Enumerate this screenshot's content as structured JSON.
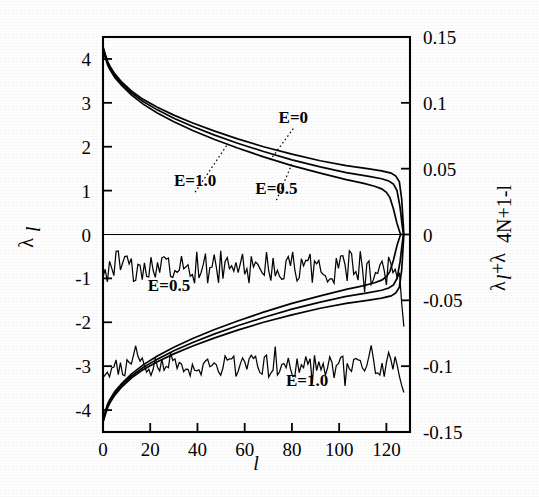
{
  "figure": {
    "background": "#ffffff",
    "ink_color": "#000000"
  },
  "chart_data": {
    "type": "line",
    "title": "",
    "subtitle": "",
    "xlabel": "l",
    "ylabel": "λ_l",
    "ylabel_right": "λ_l+λ_4N+1-l",
    "grid": false,
    "legend_position": "inline-annotations",
    "xlim": [
      0,
      130
    ],
    "ylim": [
      -4.5,
      4.5
    ],
    "ylim_right": [
      -0.15,
      0.15
    ],
    "xticks": [
      0,
      20,
      40,
      60,
      80,
      100,
      120
    ],
    "xtick_labels": [
      "0",
      "20",
      "40",
      "60",
      "80",
      "100",
      "120"
    ],
    "yticks_left": [
      4,
      3,
      2,
      1,
      0,
      -1,
      -2,
      -3,
      -4
    ],
    "ytick_labels_left": [
      "4",
      "3",
      "2",
      "1",
      "0",
      "-1",
      "-2",
      "-3",
      "-4"
    ],
    "yticks_right": [
      0.15,
      0.1,
      0.05,
      0,
      -0.05,
      -0.1,
      -0.15
    ],
    "ytick_labels_right": [
      "0.15",
      "0.1",
      "0.05",
      "0",
      "-0.05",
      "-0.1",
      "-0.15"
    ],
    "annotations": [
      {
        "text": "E=0",
        "x_frac": 0.62,
        "y_value": 2.55,
        "leader_to_x": 0.545,
        "leader_to_y": 1.7
      },
      {
        "text": "E=1.0",
        "x_frac": 0.3,
        "y_value": 1.1,
        "leader_to_x": 0.405,
        "leader_to_y": 2.05
      },
      {
        "text": "E=0.5",
        "x_frac": 0.565,
        "y_value": 0.92,
        "leader_to_x": 0.615,
        "leader_to_y": 1.6
      },
      {
        "text": "E=0.5",
        "x_frac": 0.215,
        "y_value": -1.28,
        "leader_to_x": null,
        "leader_to_y": null
      },
      {
        "text": "E=1.0",
        "x_frac": 0.665,
        "y_value": -3.45,
        "leader_to_x": null,
        "leader_to_y": null
      }
    ],
    "series": [
      {
        "name": "E=0 positive branch",
        "style": "solid",
        "comment": "Upper smooth decaying branch, starts near lambda=4.25 at l=0, decays to ~1.4 then drops to 0 near l=127",
        "points_x": [
          0,
          1,
          2,
          3,
          5,
          8,
          12,
          17,
          23,
          30,
          38,
          47,
          57,
          68,
          80,
          92,
          103,
          112,
          118,
          122,
          124,
          125.5,
          126.5,
          127,
          127.4
        ],
        "points_y": [
          4.28,
          4.1,
          3.94,
          3.83,
          3.66,
          3.47,
          3.27,
          3.08,
          2.9,
          2.72,
          2.54,
          2.36,
          2.18,
          2.0,
          1.83,
          1.68,
          1.57,
          1.5,
          1.45,
          1.4,
          1.33,
          1.2,
          0.8,
          0.35,
          0.0
        ]
      },
      {
        "name": "E=0.5 positive branch",
        "style": "solid",
        "comment": "Slightly below the E=0 branch for large l",
        "points_x": [
          0,
          1,
          2,
          3,
          5,
          8,
          12,
          17,
          23,
          30,
          38,
          47,
          57,
          68,
          80,
          92,
          103,
          112,
          118,
          121,
          123,
          124.5,
          125.8,
          126.6,
          127.2
        ],
        "points_y": [
          4.26,
          4.06,
          3.9,
          3.79,
          3.62,
          3.43,
          3.23,
          3.03,
          2.84,
          2.65,
          2.46,
          2.27,
          2.08,
          1.89,
          1.7,
          1.54,
          1.41,
          1.33,
          1.27,
          1.22,
          1.15,
          1.0,
          0.62,
          0.25,
          0.0
        ]
      },
      {
        "name": "E=1.0 positive branch",
        "style": "solid",
        "comment": "Lowest of the three upper branches at large l",
        "points_x": [
          0,
          1,
          2,
          3,
          5,
          8,
          12,
          17,
          23,
          30,
          38,
          47,
          57,
          68,
          80,
          92,
          103,
          110,
          115,
          118,
          120,
          121.5,
          123,
          124.5,
          126
        ],
        "points_y": [
          4.24,
          4.02,
          3.86,
          3.75,
          3.58,
          3.39,
          3.18,
          2.97,
          2.77,
          2.57,
          2.37,
          2.17,
          1.97,
          1.77,
          1.57,
          1.4,
          1.25,
          1.17,
          1.1,
          1.04,
          0.96,
          0.84,
          0.58,
          0.25,
          0.0
        ]
      },
      {
        "name": "E=0 negative branch",
        "style": "solid",
        "comment": "Mirror image of the positive branch below zero",
        "points_x": [
          0,
          1,
          2,
          3,
          5,
          8,
          12,
          17,
          23,
          30,
          38,
          47,
          57,
          68,
          80,
          92,
          103,
          112,
          118,
          122,
          124,
          125.5,
          126.5,
          127,
          127.4
        ],
        "points_y": [
          -4.28,
          -4.1,
          -3.94,
          -3.83,
          -3.66,
          -3.47,
          -3.27,
          -3.08,
          -2.9,
          -2.72,
          -2.54,
          -2.36,
          -2.18,
          -2.0,
          -1.83,
          -1.68,
          -1.57,
          -1.5,
          -1.45,
          -1.4,
          -1.33,
          -1.2,
          -0.8,
          -0.35,
          0.0
        ]
      },
      {
        "name": "E=0.5 negative branch",
        "style": "solid",
        "points_x": [
          0,
          1,
          2,
          3,
          5,
          8,
          12,
          17,
          23,
          30,
          38,
          47,
          57,
          68,
          80,
          92,
          103,
          112,
          118,
          121,
          123,
          124.5,
          125.8,
          126.6,
          127.2
        ],
        "points_y": [
          -4.26,
          -4.06,
          -3.9,
          -3.79,
          -3.62,
          -3.43,
          -3.23,
          -3.03,
          -2.84,
          -2.65,
          -2.46,
          -2.27,
          -2.08,
          -1.89,
          -1.7,
          -1.54,
          -1.41,
          -1.33,
          -1.27,
          -1.22,
          -1.15,
          -1.0,
          -0.62,
          -0.25,
          0.0
        ]
      },
      {
        "name": "E=1.0 negative branch",
        "style": "solid",
        "points_x": [
          0,
          1,
          2,
          3,
          5,
          8,
          12,
          17,
          23,
          30,
          38,
          47,
          57,
          68,
          80,
          92,
          103,
          110,
          115,
          118,
          120,
          121.5,
          123,
          124.5,
          126
        ],
        "points_y": [
          -4.24,
          -4.02,
          -3.86,
          -3.75,
          -3.58,
          -3.39,
          -3.18,
          -2.97,
          -2.77,
          -2.57,
          -2.37,
          -2.17,
          -1.97,
          -1.77,
          -1.57,
          -1.4,
          -1.25,
          -1.17,
          -1.1,
          -1.04,
          -0.96,
          -0.84,
          -0.58,
          -0.25,
          0.0
        ]
      },
      {
        "name": "E=0.5 sum trace",
        "style": "noisy",
        "right_axis": true,
        "comment": "Noisy fluctuating trace about right-axis value -0.025 (left-axis ~ -0.75), amplitude ~0.012",
        "mean_right": -0.025,
        "noise_amplitude_right": 0.013
      },
      {
        "name": "E=1.0 sum trace",
        "style": "noisy",
        "right_axis": true,
        "comment": "Noisy fluctuating trace about right-axis value -0.100 (left-axis ~ -3.0), amplitude ~0.008",
        "mean_right": -0.1,
        "noise_amplitude_right": 0.009
      }
    ]
  },
  "axes": {
    "x_axis_title": "l",
    "y_axis_left_title": "λ",
    "y_axis_left_sub": "l",
    "y_axis_right_title": "λ",
    "y_axis_right_sub_1": "l",
    "y_axis_right_plus": "+λ",
    "y_axis_right_sub_2": "4N+1-l"
  }
}
